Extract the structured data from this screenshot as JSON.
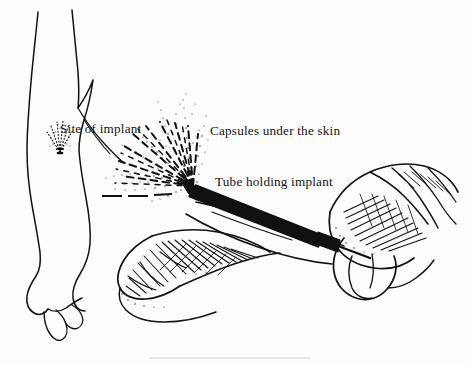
{
  "illustration": {
    "title": "Contraceptive implant insertion technique",
    "medium": "pen-and-ink line drawing",
    "background_color": "#fdfdfd",
    "ink_color": "#111111",
    "text_color": "#131313",
    "canvas": {
      "width": 470,
      "height": 365
    }
  },
  "labels": {
    "site_of_implant": "Site of implant",
    "capsules_under_the_skin": "Capsules under the skin",
    "tube_holding_implant": "Tube holding implant"
  },
  "figures": {
    "reference_arm": {
      "name": "outline drawing of an arm with implant site marked",
      "implant_site_marker": "fan of stippled capsules converging to a point on the inner upper arm"
    },
    "insertion_scene": {
      "name": "two hands performing implant insertion into a forearm",
      "left_hand": "hand steadying and tenting the patient skin, cross-hatched shading",
      "right_hand": "hand gripping the trocar, cross-hatched shading",
      "instrument": "trocar tube angled from lower right to upper left",
      "capsule_fan": "radiating dashed capsules fanned beneath the skin from the trocar tip"
    }
  },
  "capsule_fan_angles_deg": [
    -8,
    -19,
    -30,
    -41,
    -52,
    -63,
    -74,
    -85,
    -96
  ],
  "capsule_fan_lengths": [
    72,
    78,
    80,
    79,
    76,
    72,
    66,
    60,
    52
  ],
  "reference_site_angles_deg": [
    -60,
    -72,
    -84,
    -96,
    -108,
    -120
  ],
  "reference_site_lengths": [
    26,
    30,
    31,
    30,
    28,
    24
  ]
}
